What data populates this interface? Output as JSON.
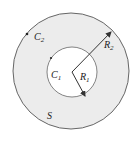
{
  "diagram": {
    "type": "annulus-region",
    "colors": {
      "fill": "#ececec",
      "stroke": "#555555",
      "background": "#ffffff"
    },
    "outer_circle": {
      "label": "C",
      "subscript": "2",
      "cx": 71,
      "cy": 71,
      "r": 58
    },
    "inner_circle": {
      "label": "C",
      "subscript": "1",
      "cx": 72,
      "cy": 72,
      "r": 25
    },
    "radius_outer": {
      "label": "R",
      "subscript": "2"
    },
    "radius_inner": {
      "label": "R",
      "subscript": "1"
    },
    "region_label": "S"
  }
}
